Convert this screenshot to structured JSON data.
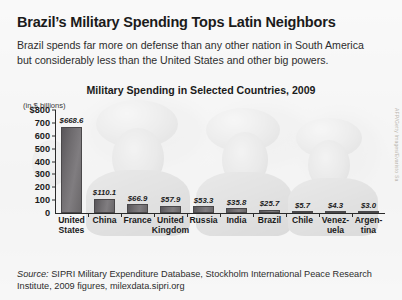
{
  "headline": "Brazil’s Military Spending Tops Latin Neighbors",
  "subtitle": "Brazil spends far more on defense than any other nation in South America but considerably less than the United States and other big powers.",
  "credit": "AFP/Getty Images/Evaristo Sa",
  "source": {
    "label": "Source:",
    "text": "SIPRI Military Expenditure Database, Stockholm International Peace Research Institute, 2009 figures, milexdata.sipri.org"
  },
  "colors": {
    "bar": "#6e6b6e",
    "axis": "#2a2a2a",
    "text": "#1b1b1b",
    "page_bg": "#fdfdfd"
  },
  "chart_data": {
    "type": "bar",
    "title": "Military Spending in Selected Countries, 2009",
    "ylabel": "(in $ billions)",
    "xlabel": "",
    "ylim": [
      0,
      800
    ],
    "yticks": [
      "$800",
      "700",
      "600",
      "500",
      "400",
      "300",
      "200",
      "100",
      "0"
    ],
    "ytick_values": [
      800,
      700,
      600,
      500,
      400,
      300,
      200,
      100,
      0
    ],
    "grid": false,
    "legend": false,
    "categories": [
      "United States",
      "China",
      "France",
      "United Kingdom",
      "Russia",
      "India",
      "Brazil",
      "Chile",
      "Venezuela",
      "Argentina"
    ],
    "category_lines": [
      [
        "United",
        "States"
      ],
      [
        "China",
        ""
      ],
      [
        "France",
        ""
      ],
      [
        "United",
        "Kingdom"
      ],
      [
        "Russia",
        ""
      ],
      [
        "India",
        ""
      ],
      [
        "Brazil",
        ""
      ],
      [
        "Chile",
        ""
      ],
      [
        "Venez-",
        "uela"
      ],
      [
        "Argen-",
        "tina"
      ]
    ],
    "values": [
      668.6,
      110.1,
      66.9,
      57.9,
      53.3,
      35.8,
      25.7,
      5.7,
      4.3,
      3.0
    ],
    "value_labels": [
      "$668.6",
      "$110.1",
      "$66.9",
      "$57.9",
      "$53.3",
      "$35.8",
      "$25.7",
      "$5.7",
      "$4.3",
      "$3.0"
    ]
  }
}
